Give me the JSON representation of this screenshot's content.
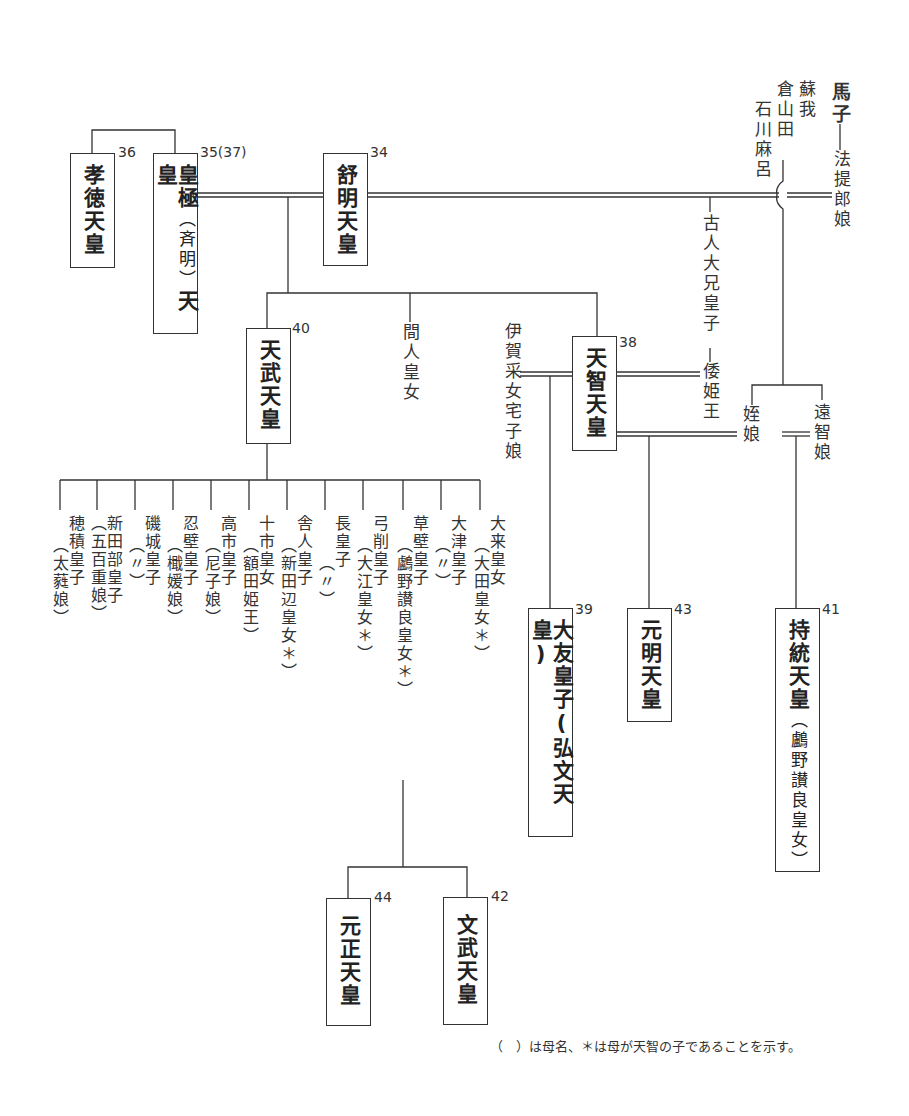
{
  "emperors": [
    {
      "id": "kotoku",
      "name": "孝徳天皇",
      "number": "36"
    },
    {
      "id": "kogyoku",
      "name": "皇極",
      "sub": "（斉明）",
      "name2": "天皇",
      "number": "35(37)"
    },
    {
      "id": "jomei",
      "name": "舒明天皇",
      "number": "34"
    },
    {
      "id": "tenmu",
      "name": "天武天皇",
      "number": "40"
    },
    {
      "id": "tenji",
      "name": "天智天皇",
      "number": "38"
    },
    {
      "id": "otomo",
      "name": "大友皇子(弘文天皇)",
      "number": "39"
    },
    {
      "id": "genmei",
      "name": "元明天皇",
      "number": "43"
    },
    {
      "id": "jito",
      "name": "持統天皇",
      "sub": "（鸕野讃良皇女）",
      "number": "41"
    },
    {
      "id": "gensho",
      "name": "元正天皇",
      "number": "44"
    },
    {
      "id": "monmu",
      "name": "文武天皇",
      "number": "42"
    }
  ],
  "persons": {
    "umako": "馬子",
    "soga": "蘇我",
    "kurayamada": "倉山田",
    "ishikawamaro": "石川麻呂",
    "hotei": "法提郎娘",
    "furuhito": "古人大兄皇子",
    "yamatohime": "倭姫王",
    "hashihito": "間人皇女",
    "iga": "伊賀采女宅子娘",
    "mei": "姪娘",
    "ochi": "遠智娘"
  },
  "tenmu_children": [
    {
      "name": "穂積皇子",
      "mother": "（太蕤娘）"
    },
    {
      "name": "新田部皇子",
      "mother": "（五百重娘）"
    },
    {
      "name": "磯城皇子",
      "mother": "（〃）"
    },
    {
      "name": "忍壁皇子",
      "mother": "（檝媛娘）"
    },
    {
      "name": "高市皇子",
      "mother": "（尼子娘）"
    },
    {
      "name": "十市皇女",
      "mother": "（額田姫王）"
    },
    {
      "name": "舎人皇子",
      "mother": "（新田辺皇女＊）"
    },
    {
      "name": "長皇子",
      "mother": "（〃）"
    },
    {
      "name": "弓削皇子",
      "mother": "（大江皇女＊）"
    },
    {
      "name": "草壁皇子",
      "mother": "（鸕野讃良皇女＊）"
    },
    {
      "name": "大津皇子",
      "mother": "（〃）"
    },
    {
      "name": "大来皇女",
      "mother": "（大田皇女＊）"
    }
  ],
  "note": "（　）は母名、＊は母が天智の子であることを示す。"
}
